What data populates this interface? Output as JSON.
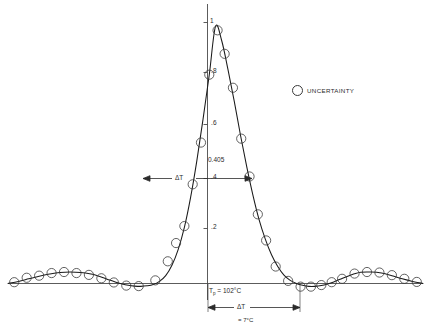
{
  "figure": {
    "background_color": "#ffffff",
    "line_color": "#1a1a1a",
    "marker_color": "#3a3a3a"
  },
  "legend": {
    "marker_name": "open-circle",
    "label": "UNCERTAINTY"
  },
  "annotations": {
    "half_width_value": "0.405",
    "delta_t_upper": "ΔT",
    "delta_t_lower": "ΔT",
    "peak_temp_label": "T",
    "peak_temp_sub": "p",
    "peak_temp_value": "= 102°C",
    "delta_t_value": "= 7°C"
  },
  "chart_data": {
    "type": "line",
    "title": "",
    "subtitle": "",
    "xlabel": "",
    "ylabel": "",
    "grid": false,
    "legend_position": "upper-right",
    "ylim": [
      -0.08,
      1.05
    ],
    "xlim": [
      -5.0,
      5.0
    ],
    "yticks": [
      0.2,
      0.4,
      0.6,
      0.8,
      1.0
    ],
    "ytick_labels": [
      ".2",
      ".4",
      ".6",
      ".8",
      "1"
    ],
    "xticks": [],
    "xtick_labels": [],
    "series": [
      {
        "name": "pulse-profile-curve",
        "style": "solid-line",
        "x": [
          -5.0,
          -4.75,
          -4.5,
          -4.25,
          -4.0,
          -3.75,
          -3.5,
          -3.25,
          -3.0,
          -2.85,
          -2.7,
          -2.55,
          -2.4,
          -2.25,
          -2.1,
          -1.95,
          -1.8,
          -1.65,
          -1.5,
          -1.35,
          -1.2,
          -1.05,
          -0.9,
          -0.75,
          -0.6,
          -0.45,
          -0.3,
          -0.15,
          0.0,
          0.15,
          0.3,
          0.45,
          0.6,
          0.75,
          0.9,
          1.05,
          1.2,
          1.35,
          1.5,
          1.65,
          1.8,
          1.95,
          2.1,
          2.25,
          2.4,
          2.55,
          2.7,
          2.85,
          3.0,
          3.25,
          3.5,
          3.75,
          4.0,
          4.25,
          4.5,
          4.75,
          5.0
        ],
        "y": [
          0.0,
          0.008,
          0.018,
          0.028,
          0.036,
          0.042,
          0.044,
          0.042,
          0.036,
          0.03,
          0.022,
          0.013,
          0.005,
          -0.002,
          -0.007,
          -0.01,
          -0.011,
          -0.009,
          -0.004,
          0.008,
          0.03,
          0.07,
          0.13,
          0.215,
          0.33,
          0.47,
          0.63,
          0.8,
          0.985,
          0.93,
          0.82,
          0.7,
          0.57,
          0.45,
          0.34,
          0.245,
          0.17,
          0.11,
          0.065,
          0.032,
          0.012,
          0.0,
          -0.007,
          -0.011,
          -0.011,
          -0.008,
          -0.002,
          0.006,
          0.016,
          0.032,
          0.043,
          0.044,
          0.04,
          0.03,
          0.018,
          0.008,
          0.0
        ]
      },
      {
        "name": "uncertainty-markers",
        "style": "open-circles",
        "marker_label": "UNCERTAINTY",
        "x": [
          -4.85,
          -4.55,
          -4.25,
          -3.95,
          -3.65,
          -3.35,
          -3.05,
          -2.75,
          -2.45,
          -2.15,
          -1.85,
          -1.45,
          -1.15,
          -0.95,
          -0.75,
          -0.55,
          -0.35,
          -0.15,
          0.05,
          0.22,
          0.42,
          0.62,
          0.82,
          1.02,
          1.22,
          1.45,
          1.75,
          2.05,
          2.3,
          2.55,
          2.8,
          3.05,
          3.35,
          3.65,
          3.95,
          4.25,
          4.55,
          4.85
        ],
        "y": [
          0.005,
          0.022,
          0.03,
          0.04,
          0.044,
          0.04,
          0.033,
          0.02,
          0.004,
          -0.008,
          -0.01,
          0.012,
          0.085,
          0.155,
          0.22,
          0.38,
          0.54,
          0.8,
          0.97,
          0.88,
          0.75,
          0.555,
          0.41,
          0.265,
          0.165,
          0.065,
          0.01,
          -0.012,
          -0.012,
          -0.006,
          0.005,
          0.018,
          0.038,
          0.044,
          0.042,
          0.032,
          0.018,
          0.006
        ]
      }
    ]
  }
}
